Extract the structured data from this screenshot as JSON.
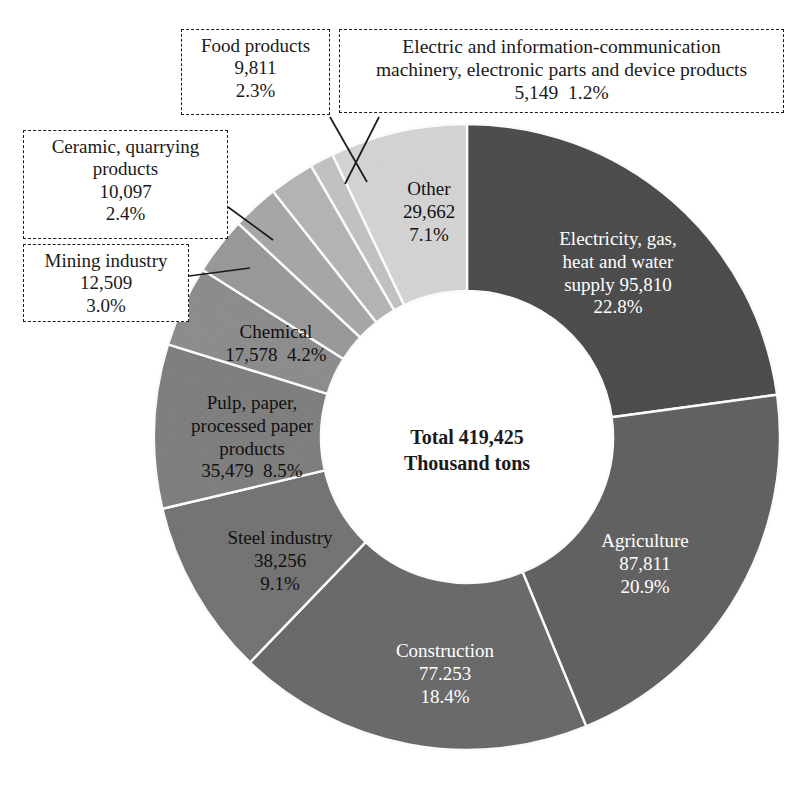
{
  "chart_data": {
    "type": "pie",
    "variant": "donut",
    "title": "",
    "center_label": {
      "line1": "Total 419,425",
      "line2": "Thousand tons"
    },
    "total_value": 419425,
    "unit": "Thousand tons",
    "start_angle_deg": 0,
    "direction": "clockwise",
    "categories": [
      "Electricity, gas, heat and water supply",
      "Agriculture",
      "Construction",
      "Steel industry",
      "Pulp, paper, processed paper products",
      "Chemical",
      "Mining industry",
      "Ceramic, quarrying products",
      "Food products",
      "Electric and information-communication machinery, electronic parts and device products",
      "Other"
    ],
    "values": [
      95810,
      87811,
      77253,
      38256,
      35479,
      17578,
      12509,
      10097,
      9811,
      5149,
      29662
    ],
    "percentages": [
      22.8,
      20.9,
      18.4,
      9.1,
      8.5,
      4.2,
      3.0,
      2.4,
      2.3,
      1.2,
      7.1
    ],
    "colors": [
      "#4e4e4e",
      "#636363",
      "#6c6c6c",
      "#767676",
      "#818181",
      "#8f8f8f",
      "#9b9b9b",
      "#a9a9a9",
      "#b6b6b6",
      "#c4c4c4",
      "#d6d6d6"
    ],
    "slice_separator_color": "#ffffff",
    "legend": "none",
    "grid": false
  },
  "slices": {
    "electricity": {
      "name": "Electricity, gas,",
      "name2": "heat and water",
      "name3": "supply 95,810",
      "value": "95,810",
      "pct": "22.8%",
      "color": "#4e4e4e"
    },
    "agriculture": {
      "name": "Agriculture",
      "value": "87,811",
      "pct": "20.9%",
      "color": "#636363"
    },
    "construction": {
      "name": "Construction",
      "value": "77.253",
      "pct": "18.4%",
      "color": "#6c6c6c"
    },
    "steel": {
      "name": "Steel industry",
      "value": "38,256",
      "pct": "9.1%",
      "color": "#767676"
    },
    "pulp": {
      "name": "Pulp, paper,",
      "name2": "processed paper",
      "name3": "products",
      "value": "35,479",
      "pct": "8.5%",
      "color": "#818181"
    },
    "chemical": {
      "name": "Chemical",
      "value": "17,578",
      "pct": "4.2%",
      "color": "#8f8f8f"
    },
    "other": {
      "name": "Other",
      "value": "29,662",
      "pct": "7.1%",
      "color": "#d6d6d6"
    }
  },
  "callouts": {
    "food": {
      "name": "Food products",
      "value": "9,811",
      "pct": "2.3%"
    },
    "electric_machinery": {
      "name": "Electric and information-communication",
      "name2": "machinery, electronic parts and device products",
      "value": "5,149",
      "pct": "1.2%"
    },
    "ceramic": {
      "name": "Ceramic, quarrying",
      "name2": "products",
      "value": "10,097",
      "pct": "2.4%"
    },
    "mining": {
      "name": "Mining industry",
      "value": "12,509",
      "pct": "3.0%"
    }
  }
}
